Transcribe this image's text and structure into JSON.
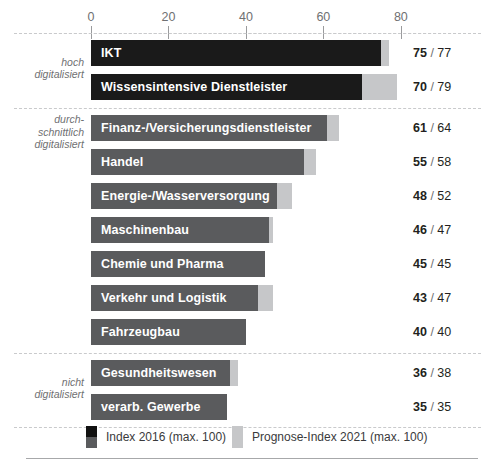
{
  "chart_data": {
    "type": "bar",
    "orientation": "horizontal",
    "title": "",
    "xlabel": "",
    "ylabel": "",
    "xlim": [
      0,
      80
    ],
    "xticks": [
      0,
      20,
      40,
      60,
      80
    ],
    "grid": false,
    "legend_position": "bottom",
    "series": [
      {
        "name": "Index 2016 (max. 100)",
        "key": "index_2016",
        "color": "#1a1a1a"
      },
      {
        "name": "Prognose-Index 2021 (max. 100)",
        "key": "prognose_2021",
        "color": "#c6c7c9"
      }
    ],
    "categories": [
      "IKT",
      "Wissensintensive Dienstleister",
      "Finanz-/Versicherungsdienstleister",
      "Handel",
      "Energie-/Wasserversorgung",
      "Maschinenbau",
      "Chemie und Pharma",
      "Verkehr und Logistik",
      "Fahrzeugbau",
      "Gesundheitswesen",
      "verarb. Gewerbe"
    ],
    "index_2016": [
      75,
      70,
      61,
      55,
      48,
      46,
      45,
      43,
      40,
      36,
      35
    ],
    "prognose_2021": [
      77,
      79,
      64,
      58,
      52,
      47,
      45,
      47,
      40,
      38,
      35
    ]
  },
  "axis": {
    "ticks": [
      "0",
      "20",
      "40",
      "60",
      "80"
    ]
  },
  "groups": [
    {
      "id": "hoch",
      "label": "hoch\ndigitalisiert",
      "label_lines": [
        "hoch",
        "digitalisiert"
      ],
      "style": "dark",
      "rows": [
        {
          "label": "IKT",
          "value": 75,
          "forecast": 77,
          "value_text": "75",
          "forecast_text": "77"
        },
        {
          "label": "Wissensintensive Dienstleister",
          "value": 70,
          "forecast": 79,
          "value_text": "70",
          "forecast_text": "79"
        }
      ]
    },
    {
      "id": "durchschnittlich",
      "label": "durch-\nschnittlich\ndigitalisiert",
      "label_lines": [
        "durch-",
        "schnittlich",
        "digitalisiert"
      ],
      "style": "mid",
      "rows": [
        {
          "label": "Finanz-/Versicherungsdienstleister",
          "value": 61,
          "forecast": 64,
          "value_text": "61",
          "forecast_text": "64"
        },
        {
          "label": "Handel",
          "value": 55,
          "forecast": 58,
          "value_text": "55",
          "forecast_text": "58"
        },
        {
          "label": "Energie-/Wasserversorgung",
          "value": 48,
          "forecast": 52,
          "value_text": "48",
          "forecast_text": "52"
        },
        {
          "label": "Maschinenbau",
          "value": 46,
          "forecast": 47,
          "value_text": "46",
          "forecast_text": "47"
        },
        {
          "label": "Chemie und Pharma",
          "value": 45,
          "forecast": 45,
          "value_text": "45",
          "forecast_text": "45"
        },
        {
          "label": "Verkehr und Logistik",
          "value": 43,
          "forecast": 47,
          "value_text": "43",
          "forecast_text": "47"
        },
        {
          "label": "Fahrzeugbau",
          "value": 40,
          "forecast": 40,
          "value_text": "40",
          "forecast_text": "40"
        }
      ]
    },
    {
      "id": "nicht",
      "label": "nicht\ndigitalisiert",
      "label_lines": [
        "nicht",
        "digitalisiert"
      ],
      "style": "mid",
      "rows": [
        {
          "label": "Gesundheitswesen",
          "value": 36,
          "forecast": 38,
          "value_text": "36",
          "forecast_text": "38"
        },
        {
          "label": "verarb. Gewerbe",
          "value": 35,
          "forecast": 35,
          "value_text": "35",
          "forecast_text": "35"
        }
      ]
    }
  ],
  "legend": {
    "items": [
      {
        "label": "Index 2016 (max. 100)",
        "swatch": "split-dark-gray"
      },
      {
        "label": "Prognose-Index 2021 (max. 100)",
        "swatch": "light-gray"
      }
    ]
  },
  "colors": {
    "bar_dark": "#1a1a1a",
    "bar_mid": "#5a5b5d",
    "bar_forecast": "#c6c7c9",
    "separator": "#c9cacc",
    "text": "#231f20",
    "muted_text": "#6f7072"
  },
  "separator_text": "/"
}
